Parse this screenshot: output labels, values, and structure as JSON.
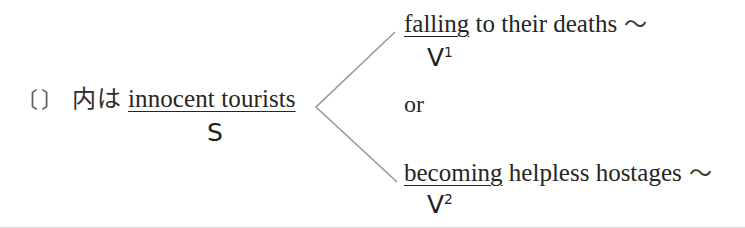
{
  "diagram": {
    "type": "sentence-structure-tree",
    "subject": {
      "bracket_open": "〔",
      "bracket_close": "〕",
      "japanese_note": "内は",
      "phrase": "innocent tourists",
      "role_label": "S",
      "underlined": true
    },
    "branches": [
      {
        "id": "v1",
        "underlined_word": "falling",
        "rest": " to their deaths",
        "trailing_mark": "〜",
        "role_label": "V",
        "role_superscript": "1"
      },
      {
        "id": "v2",
        "underlined_word": "becoming",
        "rest": " helpless hostages",
        "trailing_mark": "〜",
        "role_label": "V",
        "role_superscript": "2"
      }
    ],
    "conjunction": "or",
    "colors": {
      "background": "#ffffff",
      "text": "#26261f",
      "line": "#9a9a95",
      "bracket": "#5a5a52"
    }
  }
}
